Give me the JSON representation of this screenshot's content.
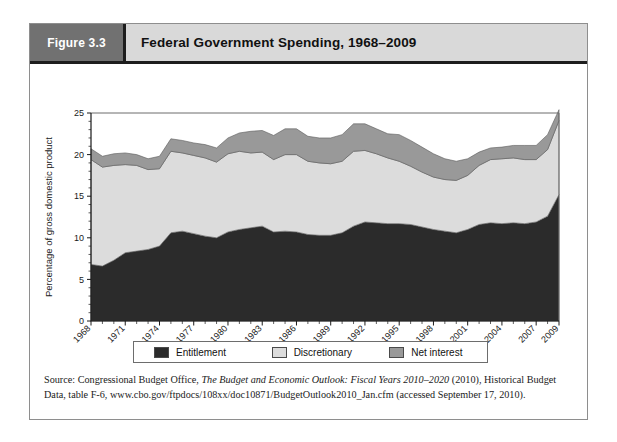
{
  "figure": {
    "number_label": "Figure 3.3",
    "title": "Federal Government Spending, 1968–2009"
  },
  "legend": {
    "items": [
      {
        "label": "Entitlement",
        "color": "#2b2b2b"
      },
      {
        "label": "Discretionary",
        "color": "#dcdcdc"
      },
      {
        "label": "Net interest",
        "color": "#999999"
      }
    ]
  },
  "source": {
    "prefix": "Source: Congressional Budget Office, ",
    "italic": "The Budget and Economic Outlook: Fiscal Years 2010–2020",
    "suffix": " (2010), Historical Budget Data, table F-6, www.cbo.gov/ftpdocs/108xx/doc10871/BudgetOutlook2010_Jan.cfm (accessed September 17, 2010)."
  },
  "chart_data": {
    "type": "area",
    "stacked": true,
    "title": "Federal Government Spending, 1968–2009",
    "xlabel": "",
    "ylabel": "Percentage of gross domestic product",
    "ylim": [
      0,
      25
    ],
    "yticks": [
      0,
      5,
      10,
      15,
      20,
      25
    ],
    "xlim": [
      1968,
      2009
    ],
    "xticks": [
      1968,
      1971,
      1974,
      1977,
      1980,
      1983,
      1986,
      1989,
      1992,
      1995,
      1998,
      2001,
      2004,
      2007,
      2009
    ],
    "grid": false,
    "legend_position": "bottom",
    "x": [
      1968,
      1969,
      1970,
      1971,
      1972,
      1973,
      1974,
      1975,
      1976,
      1977,
      1978,
      1979,
      1980,
      1981,
      1982,
      1983,
      1984,
      1985,
      1986,
      1987,
      1988,
      1989,
      1990,
      1991,
      1992,
      1993,
      1994,
      1995,
      1996,
      1997,
      1998,
      1999,
      2000,
      2001,
      2002,
      2003,
      2004,
      2005,
      2006,
      2007,
      2008,
      2009
    ],
    "series": [
      {
        "name": "Entitlement",
        "color": "#2b2b2b",
        "values": [
          6.8,
          6.6,
          7.3,
          8.2,
          8.4,
          8.6,
          9.0,
          10.6,
          10.8,
          10.5,
          10.2,
          10.0,
          10.7,
          11.0,
          11.2,
          11.4,
          10.7,
          10.8,
          10.7,
          10.4,
          10.3,
          10.3,
          10.6,
          11.4,
          11.9,
          11.8,
          11.7,
          11.7,
          11.6,
          11.3,
          11.0,
          10.8,
          10.6,
          11.0,
          11.6,
          11.8,
          11.7,
          11.8,
          11.7,
          11.9,
          12.6,
          15.2
        ]
      },
      {
        "name": "Discretionary",
        "color": "#dcdcdc",
        "values": [
          12.6,
          11.9,
          11.4,
          10.6,
          10.3,
          9.6,
          9.3,
          9.8,
          9.4,
          9.4,
          9.4,
          9.1,
          9.4,
          9.4,
          9.0,
          8.9,
          8.7,
          9.2,
          9.3,
          8.8,
          8.7,
          8.6,
          8.6,
          9.0,
          8.6,
          8.3,
          7.9,
          7.5,
          7.0,
          6.6,
          6.3,
          6.2,
          6.3,
          6.5,
          7.1,
          7.6,
          7.8,
          7.8,
          7.7,
          7.5,
          8.0,
          8.9
        ]
      },
      {
        "name": "Net interest",
        "color": "#999999",
        "values": [
          1.3,
          1.3,
          1.4,
          1.4,
          1.3,
          1.3,
          1.5,
          1.5,
          1.5,
          1.5,
          1.6,
          1.7,
          1.9,
          2.2,
          2.6,
          2.6,
          2.9,
          3.1,
          3.1,
          3.0,
          3.0,
          3.1,
          3.2,
          3.3,
          3.2,
          3.0,
          2.9,
          3.2,
          3.1,
          3.0,
          2.8,
          2.5,
          2.3,
          2.0,
          1.6,
          1.4,
          1.4,
          1.5,
          1.7,
          1.7,
          1.8,
          1.3
        ]
      }
    ]
  }
}
